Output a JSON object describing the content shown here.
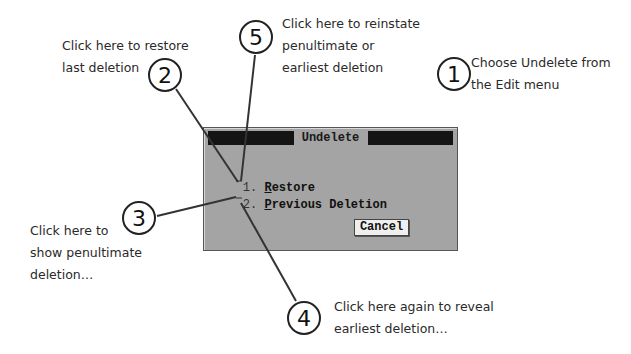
{
  "dialog": {
    "title": "Undelete",
    "options": [
      {
        "index": "1.",
        "hotkey": "R",
        "rest": "estore",
        "label": "Restore"
      },
      {
        "index": "2.",
        "hotkey": "P",
        "rest": "revious Deletion",
        "label": "Previous Deletion"
      }
    ],
    "cancel_label": "Cancel",
    "colors": {
      "body": "#a4a4a4",
      "titlebar": "#141414",
      "button": "#efefef"
    }
  },
  "callouts": [
    {
      "number": "1",
      "lines": [
        "Choose Undelete from",
        "the Edit menu"
      ]
    },
    {
      "number": "2",
      "lines": [
        "Click here to restore",
        "last deletion"
      ]
    },
    {
      "number": "3",
      "lines": [
        "Click here to",
        "show penultimate",
        "deletion…"
      ]
    },
    {
      "number": "4",
      "lines": [
        "Click here again to reveal",
        "earliest deletion…"
      ]
    },
    {
      "number": "5",
      "lines": [
        "Click here to reinstate",
        "penultimate or",
        "earliest deletion"
      ]
    }
  ]
}
